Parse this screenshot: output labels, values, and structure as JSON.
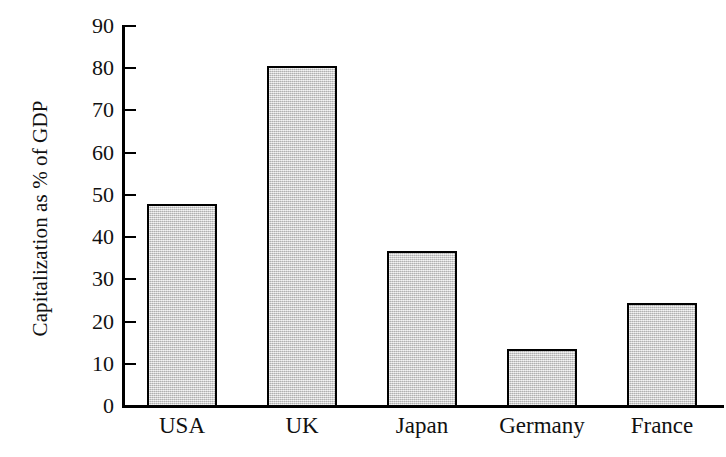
{
  "chart_data": {
    "type": "bar",
    "title": "",
    "subtitle": "",
    "xlabel": "",
    "ylabel": "Capitalization as % of GDP",
    "categories": [
      "USA",
      "UK",
      "Japan",
      "Germany",
      "France"
    ],
    "values": [
      48.2,
      80.8,
      37.0,
      13.7,
      24.7
    ],
    "series": [
      {
        "name": "Capitalization as % of GDP",
        "values": [
          48.2,
          80.8,
          37.0,
          13.7,
          24.7
        ]
      }
    ],
    "ylim": [
      0,
      90
    ],
    "ytick_step": 10,
    "ytick_labels": [
      "0",
      "10",
      "20",
      "30",
      "40",
      "50",
      "60",
      "70",
      "80",
      "90"
    ],
    "ytick_values": [
      0,
      10,
      20,
      30,
      40,
      50,
      60,
      70,
      80,
      90
    ],
    "grid": false,
    "legend": false,
    "legend_position": "none",
    "annotations": [],
    "colors": {
      "bar_fill": "#c9c9c9",
      "bar_border": "#000000",
      "axis": "#000000",
      "text": "#111111",
      "background": "#ffffff"
    }
  }
}
